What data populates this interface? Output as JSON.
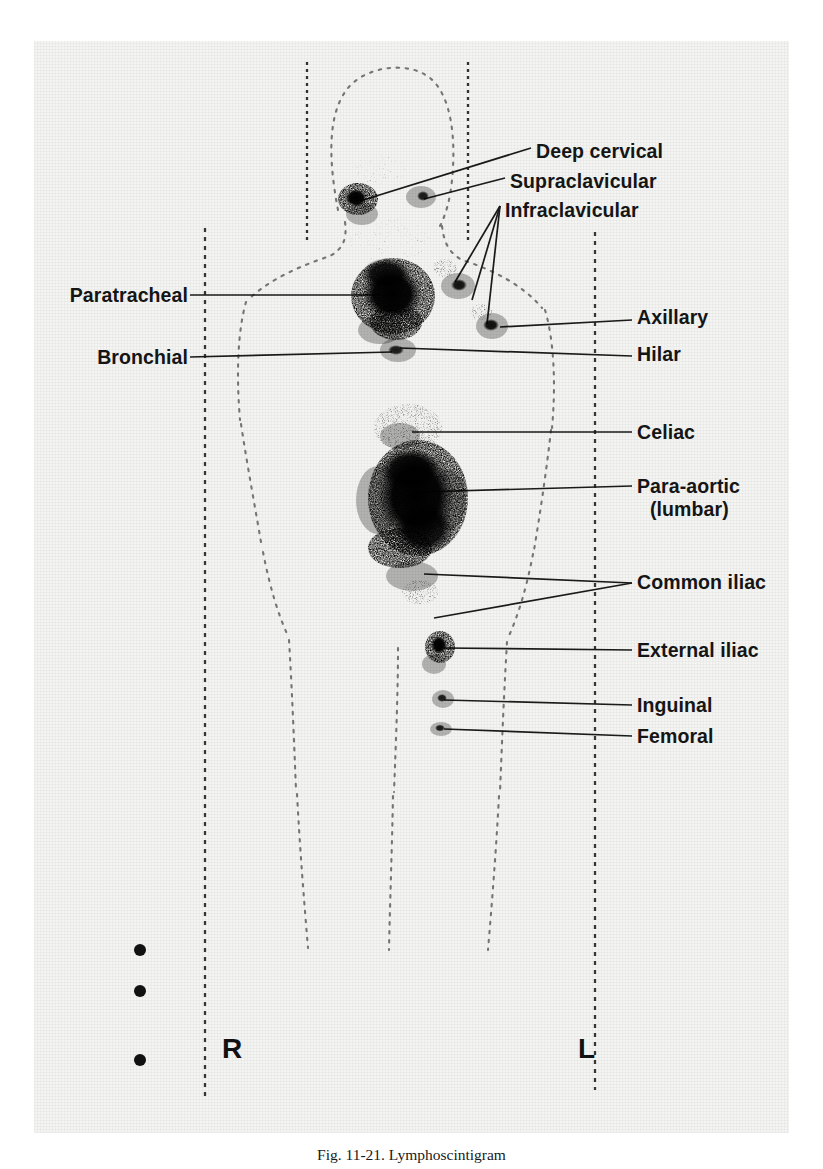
{
  "figure": {
    "title_prefix": "Fig. 11-21.",
    "caption": "Fig. 11-21.  Lymphoscintigram",
    "modality": "lymphoscintigram",
    "plate_background_hex": "#f4f4f2",
    "ink_hex": "#151515"
  },
  "orientation_markers": [
    {
      "name": "right-marker",
      "text": "R",
      "x": 222,
      "y": 1038
    },
    {
      "name": "left-marker",
      "text": "L",
      "x": 578,
      "y": 1038
    }
  ],
  "labels_right": [
    {
      "id": "deep-cervical",
      "text": "Deep cervical",
      "x": 536,
      "y": 140
    },
    {
      "id": "supraclavicular",
      "text": "Supraclavicular",
      "x": 510,
      "y": 170
    },
    {
      "id": "infraclavicular",
      "text": "Infraclavicular",
      "x": 505,
      "y": 199
    },
    {
      "id": "axillary",
      "text": "Axillary",
      "x": 637,
      "y": 316
    },
    {
      "id": "hilar",
      "text": "Hilar",
      "x": 637,
      "y": 352
    },
    {
      "id": "celiac",
      "text": "Celiac",
      "x": 637,
      "y": 428
    },
    {
      "id": "para-aortic",
      "text": "Para-aortic",
      "x": 637,
      "y": 479
    },
    {
      "id": "para-aortic-sub",
      "text": "(lumbar)",
      "x": 646,
      "y": 501
    },
    {
      "id": "common-iliac",
      "text": "Common iliac",
      "x": 637,
      "y": 578
    },
    {
      "id": "external-iliac",
      "text": "External iliac",
      "x": 637,
      "y": 645
    },
    {
      "id": "inguinal",
      "text": "Inguinal",
      "x": 637,
      "y": 700
    },
    {
      "id": "femoral",
      "text": "Femoral",
      "x": 637,
      "y": 731
    }
  ],
  "labels_left": [
    {
      "id": "paratracheal",
      "text": "Paratracheal",
      "x": 182,
      "y": 288
    },
    {
      "id": "bronchial",
      "text": "Bronchial",
      "x": 182,
      "y": 350
    }
  ],
  "node_groups": [
    {
      "id": "deep-cervical-node",
      "label": "Deep cervical",
      "cx": 358,
      "cy": 199,
      "intensity": "focal"
    },
    {
      "id": "supraclavicular-node",
      "label": "Supraclavicular",
      "cx": 420,
      "cy": 197,
      "intensity": "faint"
    },
    {
      "id": "paratracheal-mass",
      "label": "Paratracheal",
      "cx": 393,
      "cy": 295,
      "intensity": "dense"
    },
    {
      "id": "infraclavicular-node",
      "label": "Infraclavicular",
      "cx": 462,
      "cy": 293,
      "intensity": "moderate"
    },
    {
      "id": "axillary-node",
      "label": "Axillary",
      "cx": 492,
      "cy": 327,
      "intensity": "moderate"
    },
    {
      "id": "hilar-node",
      "label": "Hilar",
      "cx": 398,
      "cy": 350,
      "intensity": "moderate"
    },
    {
      "id": "celiac-node",
      "label": "Celiac",
      "cx": 408,
      "cy": 430,
      "intensity": "faint"
    },
    {
      "id": "para-aortic-mass",
      "label": "Para-aortic",
      "cx": 420,
      "cy": 497,
      "intensity": "dense"
    },
    {
      "id": "common-iliac-node",
      "label": "Common iliac",
      "cx": 422,
      "cy": 580,
      "intensity": "faint"
    },
    {
      "id": "external-iliac-node",
      "label": "External iliac",
      "cx": 440,
      "cy": 645,
      "intensity": "moderate"
    },
    {
      "id": "inguinal-node",
      "label": "Inguinal",
      "cx": 443,
      "cy": 699,
      "intensity": "faint"
    },
    {
      "id": "femoral-node",
      "label": "Femoral",
      "cx": 442,
      "cy": 728,
      "intensity": "faint"
    }
  ],
  "reference_lines": [
    {
      "id": "right-vertical-reference",
      "x": 205,
      "y1": 228,
      "y2": 1098
    },
    {
      "id": "left-vertical-reference",
      "x": 595,
      "y1": 232,
      "y2": 1090
    },
    {
      "id": "neck-right-reference",
      "x": 307,
      "y1": 62,
      "y2": 240
    },
    {
      "id": "neck-left-reference",
      "x": 468,
      "y1": 62,
      "y2": 240
    }
  ],
  "fiducial_markers": [
    {
      "id": "fiducial-1",
      "cx": 140,
      "cy": 950
    },
    {
      "id": "fiducial-2",
      "cx": 140,
      "cy": 991
    },
    {
      "id": "fiducial-3",
      "cx": 140,
      "cy": 1060
    }
  ],
  "body_outline": {
    "id": "body-silhouette",
    "style": "dotted",
    "parts": [
      "head",
      "neck",
      "shoulders",
      "torso",
      "hips",
      "legs"
    ]
  }
}
